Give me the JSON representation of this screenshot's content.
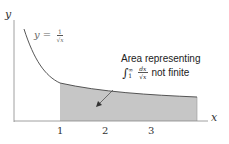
{
  "axes": {
    "x_label": "x",
    "y_label": "y",
    "x_ticks": [
      "1",
      "2",
      "3"
    ]
  },
  "curve": {
    "label_lhs": "y =",
    "label_num": "1",
    "label_den": "√x",
    "color": "#333333"
  },
  "annotation": {
    "line1": "Area representing",
    "integral_symbol": "∫",
    "upper_limit": "∞",
    "lower_limit": "1",
    "integrand_num": "dx",
    "integrand_den": "√x",
    "suffix": "not finite"
  },
  "shaded_region": {
    "from_x": 1,
    "color": "#c8c8c8"
  }
}
